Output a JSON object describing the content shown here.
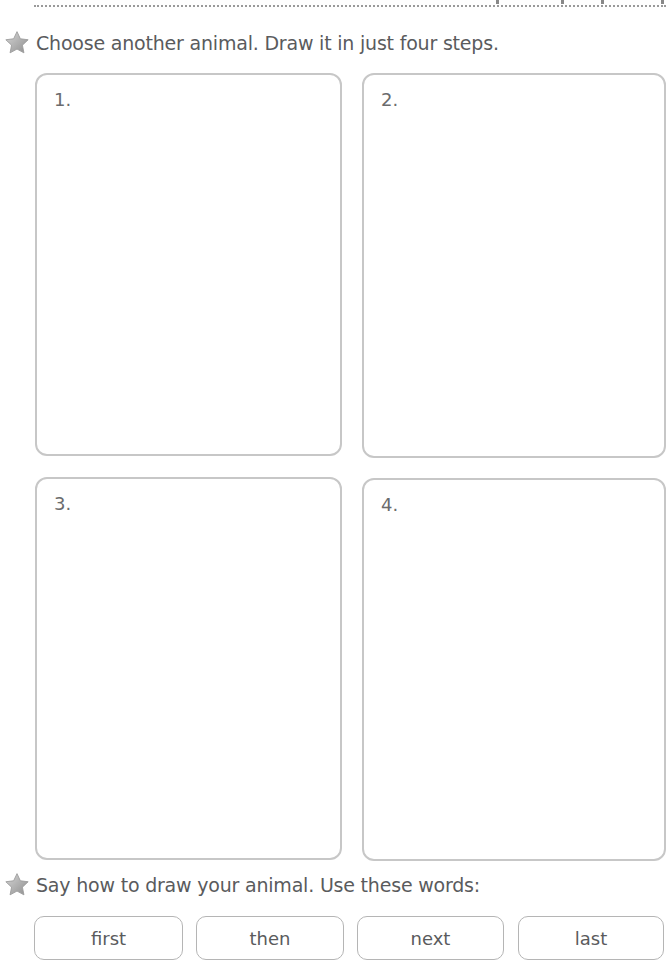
{
  "header": {
    "divider": "dotted-line"
  },
  "task1": {
    "icon": "star-icon",
    "instruction": "Choose another animal. Draw it in just four steps.",
    "steps": [
      {
        "label": "1."
      },
      {
        "label": "2."
      },
      {
        "label": "3."
      },
      {
        "label": "4."
      }
    ]
  },
  "task2": {
    "icon": "star-icon",
    "instruction": "Say how to draw your animal. Use these words:",
    "words": [
      "first",
      "then",
      "next",
      "last"
    ]
  },
  "colors": {
    "text": "#5a5b5d",
    "border": "#c7c7c7",
    "star": "#a9a9a9"
  }
}
